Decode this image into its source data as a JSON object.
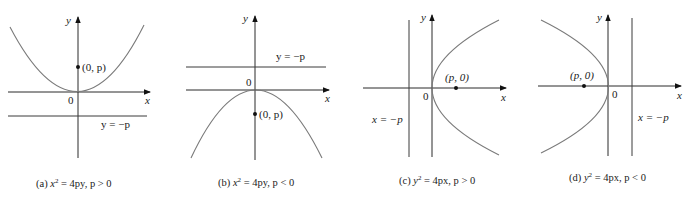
{
  "panels": [
    {
      "id": "a",
      "caption": {
        "prefix": "(a) ",
        "lhs": "x",
        "exp": "2",
        "rhs": " = 4py, p > 0"
      },
      "axis_labels": {
        "x": "x",
        "y": "y",
        "origin": "0"
      },
      "focus_label": "(0, p)",
      "directrix_label": "y = −p"
    },
    {
      "id": "b",
      "caption": {
        "prefix": "(b) ",
        "lhs": "x",
        "exp": "2",
        "rhs": " = 4py, p < 0"
      },
      "axis_labels": {
        "x": "x",
        "y": "y",
        "origin": "0"
      },
      "focus_label": "(0, p)",
      "directrix_label": "y = −p"
    },
    {
      "id": "c",
      "caption": {
        "prefix": "(c) ",
        "lhs": "y",
        "exp": "2",
        "rhs": " = 4px, p > 0"
      },
      "axis_labels": {
        "x": "x",
        "y": "y",
        "origin": "0"
      },
      "focus_label": "(p, 0)",
      "directrix_label": "x = −p"
    },
    {
      "id": "d",
      "caption": {
        "prefix": "(d) ",
        "lhs": "y",
        "exp": "2",
        "rhs": " = 4px, p < 0"
      },
      "axis_labels": {
        "x": "x",
        "y": "y",
        "origin": "0"
      },
      "focus_label": "(p, 0)",
      "directrix_label": "x = −p"
    }
  ]
}
